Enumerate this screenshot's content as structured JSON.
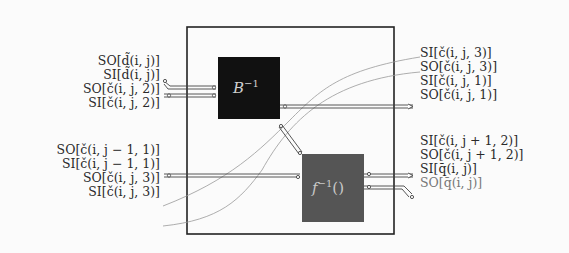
{
  "diagram": {
    "type": "block-diagram",
    "outer_box": {
      "x": 187,
      "y": 27,
      "w": 207,
      "h": 207,
      "stroke": "#222222"
    },
    "blocks": [
      {
        "id": "B_inv",
        "label": "B",
        "superscript": "−1",
        "suffix": "",
        "x": 218,
        "y": 57,
        "w": 62,
        "h": 62,
        "fill": "#111111"
      },
      {
        "id": "f_inv",
        "label": "f",
        "superscript": "−1",
        "suffix": "()",
        "x": 302,
        "y": 154,
        "w": 62,
        "h": 68,
        "fill": "#555555"
      }
    ],
    "left_labels": [
      {
        "text": "SO[d̃(i, j)]",
        "y": 60,
        "dim": false
      },
      {
        "text": "SI[d̃(i, j)]",
        "y": 73,
        "dim": false
      },
      {
        "text": "SO[č(i, j, 2)]",
        "y": 87,
        "dim": false
      },
      {
        "text": "SI[č(i, j, 2)]",
        "y": 101,
        "dim": false
      },
      {
        "text": "SO[č(i, j − 1, 1)]",
        "y": 148,
        "dim": false
      },
      {
        "text": "SI[č(i, j − 1, 1)]",
        "y": 162,
        "dim": false
      },
      {
        "text": "SO[č(i, j, 3)]",
        "y": 176,
        "dim": false
      },
      {
        "text": "SI[č(i, j, 3)]",
        "y": 191,
        "dim": false
      }
    ],
    "right_labels": [
      {
        "text": "SI[č(i, j, 3)]",
        "y": 51,
        "dim": false
      },
      {
        "text": "SO[č(i, j, 3)]",
        "y": 66,
        "dim": false
      },
      {
        "text": "SI[č(i, j, 1)]",
        "y": 80,
        "dim": false
      },
      {
        "text": "SO[č(i, j, 1)]",
        "y": 94,
        "dim": false
      },
      {
        "text": "SI[č(i, j + 1, 2)]",
        "y": 139,
        "dim": false
      },
      {
        "text": "SO[č(i, j + 1, 2)]",
        "y": 153,
        "dim": false
      },
      {
        "text": "SI[q̄(i, j)]",
        "y": 167,
        "dim": false
      },
      {
        "text": "SO[q̄(i, j)]",
        "y": 181,
        "dim": true
      }
    ]
  }
}
